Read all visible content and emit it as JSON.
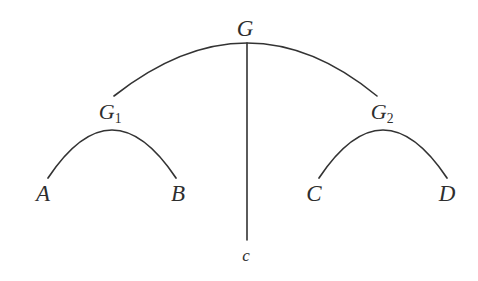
{
  "diagram": {
    "type": "arc-tree",
    "background_color": "#ffffff",
    "stroke_color": "#333333",
    "stroke_width": 1.6,
    "nodes": [
      {
        "id": "G",
        "label": "G",
        "sub": "",
        "x": 245,
        "y": 28,
        "role": "root"
      },
      {
        "id": "G1",
        "label": "G",
        "sub": "1",
        "x": 110,
        "y": 112,
        "role": "internal"
      },
      {
        "id": "G2",
        "label": "G",
        "sub": "2",
        "x": 382,
        "y": 112,
        "role": "internal"
      },
      {
        "id": "A",
        "label": "A",
        "sub": "",
        "x": 43,
        "y": 193,
        "role": "leaf"
      },
      {
        "id": "B",
        "label": "B",
        "sub": "",
        "x": 178,
        "y": 193,
        "role": "leaf"
      },
      {
        "id": "C",
        "label": "C",
        "sub": "",
        "x": 314,
        "y": 193,
        "role": "leaf"
      },
      {
        "id": "D",
        "label": "D",
        "sub": "",
        "x": 447,
        "y": 193,
        "role": "leaf"
      },
      {
        "id": "c",
        "label": "c",
        "sub": "",
        "x": 246,
        "y": 255,
        "role": "terminal"
      }
    ],
    "arcs": [
      {
        "id": "arc-G",
        "from": "G1",
        "to": "G2",
        "apex_x": 247,
        "apex_y": 43,
        "left_x": 114,
        "left_y": 96,
        "right_x": 377,
        "right_y": 96
      },
      {
        "id": "arc-G1",
        "from": "A",
        "to": "B",
        "apex_x": 112,
        "apex_y": 130,
        "left_x": 48,
        "left_y": 178,
        "right_x": 176,
        "right_y": 178
      },
      {
        "id": "arc-G2",
        "from": "C",
        "to": "D",
        "apex_x": 383,
        "apex_y": 130,
        "left_x": 319,
        "left_y": 178,
        "right_x": 447,
        "right_y": 178
      }
    ],
    "edges": [
      {
        "id": "edge-G-c",
        "from": "G",
        "to": "c",
        "x1": 247,
        "y1": 43,
        "x2": 247,
        "y2": 240
      }
    ]
  }
}
